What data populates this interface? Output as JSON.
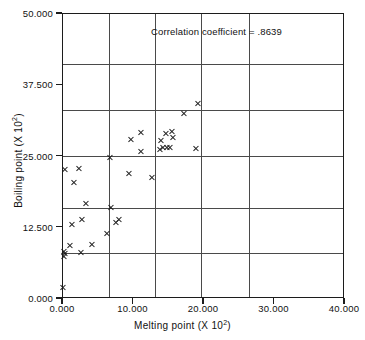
{
  "chart_data": {
    "type": "scatter",
    "title": "",
    "xlabel": "Melting point (X 10²)",
    "ylabel": "Boiling point (X 10²)",
    "xlabel_base": "Melting point (X  10",
    "xlabel_exp": "2",
    "xlabel_close": ")",
    "ylabel_base": "Boiling point (X  10",
    "ylabel_exp": "2",
    "ylabel_close": ")",
    "xlim": [
      0.0,
      40.0
    ],
    "ylim": [
      0.0,
      50.0
    ],
    "xticks": [
      0.0,
      10.0,
      20.0,
      30.0,
      40.0
    ],
    "yticks": [
      0.0,
      12.5,
      25.0,
      37.5,
      50.0
    ],
    "xtick_labels": [
      "0.000",
      "10.000",
      "20.000",
      "30.000",
      "40.000"
    ],
    "ytick_labels": [
      "0.000",
      "12.500",
      "25.000",
      "37.500",
      "50.000"
    ],
    "grid": true,
    "grid_x_values": [
      6.5,
      13.0,
      19.6,
      26.4
    ],
    "grid_y_values": [
      8.0,
      16.0,
      25.1,
      33.2,
      41.3
    ],
    "legend": "",
    "annotation": "Correlation coefficient  =  .8639",
    "correlation_coefficient": 0.8639,
    "marker": "x",
    "marker_color": "#1c1c1c",
    "n_points": 38,
    "points": [
      {
        "x": 0.0,
        "y": 2.0
      },
      {
        "x": 0.1,
        "y": 7.5
      },
      {
        "x": 0.2,
        "y": 8.3
      },
      {
        "x": 0.25,
        "y": 8.0
      },
      {
        "x": 0.3,
        "y": 22.8
      },
      {
        "x": 1.0,
        "y": 9.4
      },
      {
        "x": 1.2,
        "y": 13.1
      },
      {
        "x": 1.5,
        "y": 20.4
      },
      {
        "x": 2.2,
        "y": 22.9
      },
      {
        "x": 2.5,
        "y": 8.1
      },
      {
        "x": 2.7,
        "y": 14.0
      },
      {
        "x": 3.2,
        "y": 16.8
      },
      {
        "x": 4.1,
        "y": 9.5
      },
      {
        "x": 6.3,
        "y": 11.5
      },
      {
        "x": 6.6,
        "y": 24.8
      },
      {
        "x": 6.8,
        "y": 16.1
      },
      {
        "x": 7.5,
        "y": 13.4
      },
      {
        "x": 8.0,
        "y": 14.0
      },
      {
        "x": 9.4,
        "y": 22.0
      },
      {
        "x": 9.6,
        "y": 28.0
      },
      {
        "x": 11.0,
        "y": 29.3
      },
      {
        "x": 11.1,
        "y": 25.9
      },
      {
        "x": 12.6,
        "y": 21.4
      },
      {
        "x": 13.7,
        "y": 26.2
      },
      {
        "x": 13.9,
        "y": 27.8
      },
      {
        "x": 14.2,
        "y": 26.5
      },
      {
        "x": 14.6,
        "y": 29.0
      },
      {
        "x": 14.8,
        "y": 26.6
      },
      {
        "x": 15.2,
        "y": 26.6
      },
      {
        "x": 15.5,
        "y": 29.4
      },
      {
        "x": 15.6,
        "y": 28.3
      },
      {
        "x": 17.1,
        "y": 32.5
      },
      {
        "x": 18.8,
        "y": 26.4
      },
      {
        "x": 19.1,
        "y": 34.3
      }
    ]
  }
}
